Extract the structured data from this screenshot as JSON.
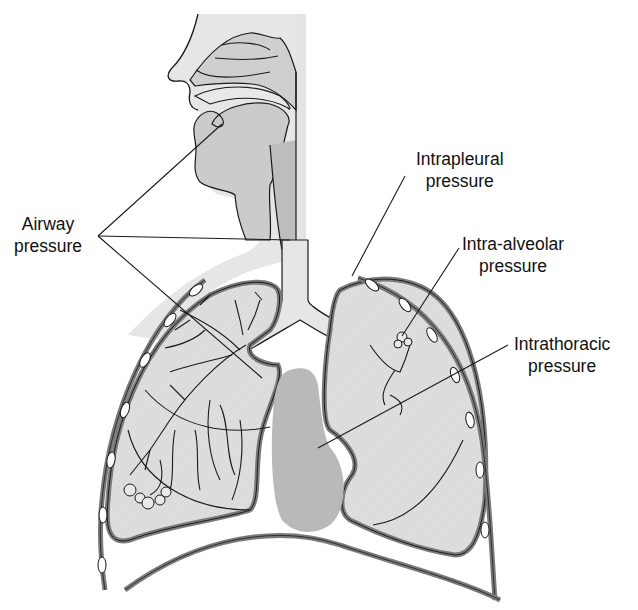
{
  "diagram": {
    "colors": {
      "tissue_fill": "#e2e2e2",
      "lung_fill": "#dcdcdc",
      "airway_fill": "#cfcfcf",
      "heart_fill": "#b9b9b9",
      "pleura_stroke": "#7a7a7a",
      "outline": "#1a1a1a",
      "background": "#ffffff"
    },
    "labels": [
      {
        "id": "airway",
        "line1": "Airway",
        "line2": "pressure"
      },
      {
        "id": "intrapleural",
        "line1": "Intrapleural",
        "line2": "pressure"
      },
      {
        "id": "intra_alveolar",
        "line1": "Intra-alveolar",
        "line2": "pressure"
      },
      {
        "id": "intrathoracic",
        "line1": "Intrathoracic",
        "line2": "pressure"
      }
    ]
  }
}
